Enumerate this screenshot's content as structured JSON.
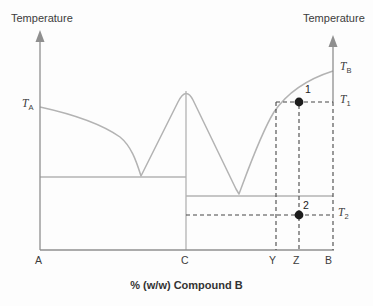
{
  "figure": {
    "type": "phase-diagram"
  },
  "axes": {
    "left_axis_label": "Temperature",
    "right_axis_label": "Temperature",
    "x_axis_title": "% (w/w) Compound B",
    "x_ticks": [
      "A",
      "C",
      "Y",
      "Z",
      "B"
    ]
  },
  "temperature_labels": {
    "ta": {
      "base": "T",
      "sub": "A"
    },
    "tb": {
      "base": "T",
      "sub": "B"
    },
    "t1": {
      "base": "T",
      "sub": "1"
    },
    "t2": {
      "base": "T",
      "sub": "2"
    }
  },
  "points": {
    "p1": {
      "label": "1"
    },
    "p2": {
      "label": "2"
    }
  },
  "colors": {
    "curve": "#b3b3b3",
    "axis": "#8f8f8f",
    "dashed_line": "#474747",
    "point_fill": "#1c1c1c",
    "text": "#3c3c3c",
    "background": "#fdfdfd"
  }
}
